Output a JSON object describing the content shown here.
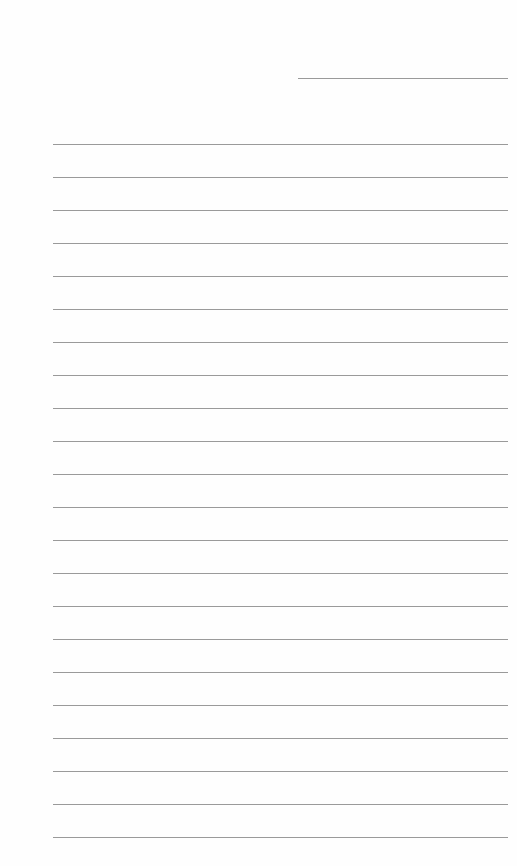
{
  "document": {
    "type": "lined-paper",
    "header_line": {
      "x": 298,
      "y": 78,
      "width": 210
    },
    "ruled_lines": {
      "count": 22,
      "start_y": 144,
      "spacing": 33,
      "left": 53,
      "right": 508
    },
    "line_color": "#9a9a9a",
    "background_color": "#fefefe"
  }
}
